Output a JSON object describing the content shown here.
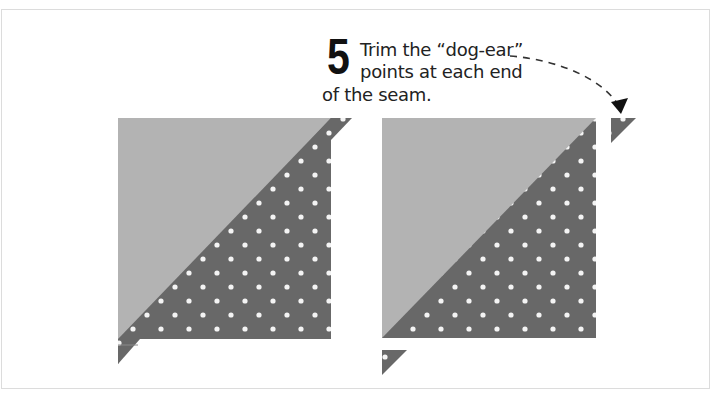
{
  "instruction": {
    "step_number": "5",
    "lines": [
      "Trim the “dog-ear”",
      "points at each end",
      "of the seam."
    ]
  },
  "figures": [
    {
      "name": "before-trim",
      "description": "half-square triangle block with dog-ear points at each end of the diagonal seam"
    },
    {
      "name": "after-trim",
      "description": "half-square triangle block with dog-ear points trimmed off and shown separately"
    }
  ],
  "colors": {
    "light_fabric": "#b3b3b3",
    "dark_fabric": "#686868",
    "dots": "#f4f4f4",
    "arrow": "#222222"
  }
}
